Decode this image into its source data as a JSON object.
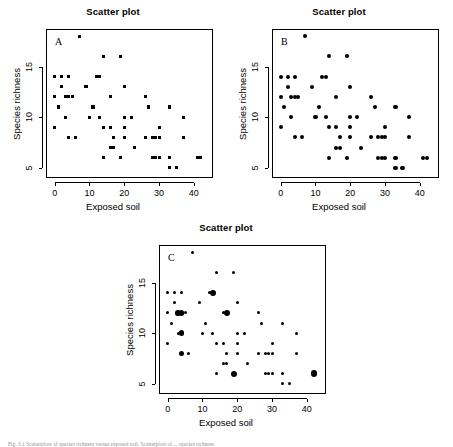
{
  "figure": {
    "caption": "Fig. 3.1 Scatterplots of species richness versus exposed soil. Scatterplots of ... species richness",
    "panels": [
      {
        "letter": "A",
        "title": "Scatter plot",
        "marker": "square"
      },
      {
        "letter": "B",
        "title": "Scatter plot",
        "marker": "circle"
      },
      {
        "letter": "C",
        "title": "Scatter plot",
        "marker": "bubble"
      }
    ]
  },
  "chart_data": [
    {
      "type": "scatter",
      "panel": "A",
      "title": "Scatter plot",
      "xlabel": "Exposed soil",
      "ylabel": "Species richness",
      "xlim": [
        -2.5,
        45.5
      ],
      "ylim": [
        4.0,
        18.7
      ],
      "xticks": [
        0,
        10,
        20,
        30,
        40
      ],
      "yticks": [
        5,
        10,
        15
      ],
      "grid": false,
      "marker": "filled-square",
      "marker_size": 3.0,
      "color": "#000000",
      "points": [
        {
          "x": 0,
          "y": 14
        },
        {
          "x": 0,
          "y": 12
        },
        {
          "x": 0,
          "y": 9
        },
        {
          "x": 1,
          "y": 11
        },
        {
          "x": 2,
          "y": 14
        },
        {
          "x": 2,
          "y": 13
        },
        {
          "x": 3,
          "y": 12
        },
        {
          "x": 3,
          "y": 10
        },
        {
          "x": 4,
          "y": 14
        },
        {
          "x": 4,
          "y": 12
        },
        {
          "x": 4,
          "y": 8
        },
        {
          "x": 5,
          "y": 12
        },
        {
          "x": 6,
          "y": 8
        },
        {
          "x": 7,
          "y": 18
        },
        {
          "x": 9,
          "y": 13
        },
        {
          "x": 10,
          "y": 10
        },
        {
          "x": 11,
          "y": 11
        },
        {
          "x": 12,
          "y": 14
        },
        {
          "x": 13,
          "y": 14
        },
        {
          "x": 13,
          "y": 10
        },
        {
          "x": 14,
          "y": 16
        },
        {
          "x": 14,
          "y": 9
        },
        {
          "x": 14,
          "y": 6
        },
        {
          "x": 16,
          "y": 12
        },
        {
          "x": 16,
          "y": 9
        },
        {
          "x": 16,
          "y": 7
        },
        {
          "x": 17,
          "y": 7
        },
        {
          "x": 17,
          "y": 8
        },
        {
          "x": 19,
          "y": 16
        },
        {
          "x": 19,
          "y": 6
        },
        {
          "x": 20,
          "y": 13
        },
        {
          "x": 20,
          "y": 10
        },
        {
          "x": 20,
          "y": 9
        },
        {
          "x": 20,
          "y": 8
        },
        {
          "x": 22,
          "y": 10
        },
        {
          "x": 23,
          "y": 7
        },
        {
          "x": 26,
          "y": 12
        },
        {
          "x": 26,
          "y": 8
        },
        {
          "x": 27,
          "y": 11
        },
        {
          "x": 28,
          "y": 8
        },
        {
          "x": 28,
          "y": 6
        },
        {
          "x": 29,
          "y": 6
        },
        {
          "x": 29,
          "y": 8
        },
        {
          "x": 30,
          "y": 9
        },
        {
          "x": 30,
          "y": 8
        },
        {
          "x": 30,
          "y": 6
        },
        {
          "x": 33,
          "y": 11
        },
        {
          "x": 33,
          "y": 6
        },
        {
          "x": 33,
          "y": 5
        },
        {
          "x": 35,
          "y": 5
        },
        {
          "x": 37,
          "y": 10
        },
        {
          "x": 37,
          "y": 8
        },
        {
          "x": 41,
          "y": 6
        },
        {
          "x": 42,
          "y": 6
        }
      ]
    },
    {
      "type": "scatter",
      "panel": "B",
      "title": "Scatter plot",
      "xlabel": "Exposed soil",
      "ylabel": "Species richness",
      "xlim": [
        -2.5,
        45.5
      ],
      "ylim": [
        4.0,
        18.7
      ],
      "xticks": [
        0,
        10,
        20,
        30,
        40
      ],
      "yticks": [
        5,
        10,
        15
      ],
      "grid": false,
      "marker": "filled-circle",
      "marker_size": 4.0,
      "color": "#000000",
      "points": [
        {
          "x": 0,
          "y": 14
        },
        {
          "x": 0,
          "y": 12
        },
        {
          "x": 0,
          "y": 9
        },
        {
          "x": 1,
          "y": 11
        },
        {
          "x": 2,
          "y": 14
        },
        {
          "x": 2,
          "y": 13
        },
        {
          "x": 3,
          "y": 12
        },
        {
          "x": 3,
          "y": 10
        },
        {
          "x": 4,
          "y": 14
        },
        {
          "x": 4,
          "y": 12
        },
        {
          "x": 4,
          "y": 8
        },
        {
          "x": 5,
          "y": 12
        },
        {
          "x": 6,
          "y": 8
        },
        {
          "x": 7,
          "y": 18
        },
        {
          "x": 9,
          "y": 13
        },
        {
          "x": 10,
          "y": 10
        },
        {
          "x": 11,
          "y": 11
        },
        {
          "x": 12,
          "y": 14
        },
        {
          "x": 13,
          "y": 14
        },
        {
          "x": 13,
          "y": 10
        },
        {
          "x": 14,
          "y": 16
        },
        {
          "x": 14,
          "y": 9
        },
        {
          "x": 14,
          "y": 6
        },
        {
          "x": 16,
          "y": 12
        },
        {
          "x": 16,
          "y": 9
        },
        {
          "x": 16,
          "y": 7
        },
        {
          "x": 17,
          "y": 7
        },
        {
          "x": 17,
          "y": 8
        },
        {
          "x": 19,
          "y": 16
        },
        {
          "x": 19,
          "y": 6
        },
        {
          "x": 20,
          "y": 13
        },
        {
          "x": 20,
          "y": 10
        },
        {
          "x": 20,
          "y": 9
        },
        {
          "x": 20,
          "y": 8
        },
        {
          "x": 22,
          "y": 10
        },
        {
          "x": 23,
          "y": 7
        },
        {
          "x": 26,
          "y": 12
        },
        {
          "x": 26,
          "y": 8
        },
        {
          "x": 27,
          "y": 11
        },
        {
          "x": 28,
          "y": 8
        },
        {
          "x": 28,
          "y": 6
        },
        {
          "x": 29,
          "y": 6
        },
        {
          "x": 29,
          "y": 8
        },
        {
          "x": 30,
          "y": 9
        },
        {
          "x": 30,
          "y": 8
        },
        {
          "x": 30,
          "y": 6
        },
        {
          "x": 33,
          "y": 11
        },
        {
          "x": 33,
          "y": 6
        },
        {
          "x": 33,
          "y": 5
        },
        {
          "x": 35,
          "y": 5
        },
        {
          "x": 37,
          "y": 10
        },
        {
          "x": 37,
          "y": 8
        },
        {
          "x": 41,
          "y": 6
        },
        {
          "x": 42,
          "y": 6
        }
      ]
    },
    {
      "type": "scatter",
      "panel": "C",
      "title": "Scatter plot",
      "xlabel": "Exposed soil",
      "ylabel": "Species richness",
      "xlim": [
        -2.5,
        45.5
      ],
      "ylim": [
        4.0,
        18.7
      ],
      "xticks": [
        0,
        10,
        20,
        30,
        40
      ],
      "yticks": [
        5,
        10,
        15
      ],
      "grid": false,
      "marker": "bubble",
      "size_meaning": "marker area proportional to number of coincident observations",
      "color": "#000000",
      "points": [
        {
          "x": 0,
          "y": 14,
          "size": 1
        },
        {
          "x": 0,
          "y": 12,
          "size": 1
        },
        {
          "x": 0,
          "y": 9,
          "size": 1
        },
        {
          "x": 1,
          "y": 11,
          "size": 1
        },
        {
          "x": 2,
          "y": 14,
          "size": 1
        },
        {
          "x": 2,
          "y": 13,
          "size": 1
        },
        {
          "x": 3,
          "y": 12,
          "size": 3
        },
        {
          "x": 3,
          "y": 10,
          "size": 1
        },
        {
          "x": 4,
          "y": 14,
          "size": 1
        },
        {
          "x": 4,
          "y": 12,
          "size": 3
        },
        {
          "x": 4,
          "y": 10,
          "size": 3
        },
        {
          "x": 4,
          "y": 8,
          "size": 3
        },
        {
          "x": 5,
          "y": 12,
          "size": 1
        },
        {
          "x": 6,
          "y": 8,
          "size": 1
        },
        {
          "x": 7,
          "y": 18,
          "size": 1
        },
        {
          "x": 9,
          "y": 13,
          "size": 1
        },
        {
          "x": 10,
          "y": 10,
          "size": 1
        },
        {
          "x": 11,
          "y": 11,
          "size": 1
        },
        {
          "x": 12,
          "y": 14,
          "size": 1
        },
        {
          "x": 13,
          "y": 14,
          "size": 4
        },
        {
          "x": 13,
          "y": 10,
          "size": 1
        },
        {
          "x": 14,
          "y": 16,
          "size": 1
        },
        {
          "x": 14,
          "y": 9,
          "size": 1
        },
        {
          "x": 14,
          "y": 6,
          "size": 1
        },
        {
          "x": 16,
          "y": 12,
          "size": 1
        },
        {
          "x": 16,
          "y": 9,
          "size": 1
        },
        {
          "x": 16,
          "y": 7,
          "size": 1
        },
        {
          "x": 17,
          "y": 12,
          "size": 4
        },
        {
          "x": 17,
          "y": 7,
          "size": 1
        },
        {
          "x": 17,
          "y": 8,
          "size": 1
        },
        {
          "x": 19,
          "y": 16,
          "size": 1
        },
        {
          "x": 19,
          "y": 6,
          "size": 4
        },
        {
          "x": 20,
          "y": 13,
          "size": 1
        },
        {
          "x": 20,
          "y": 10,
          "size": 1
        },
        {
          "x": 20,
          "y": 9,
          "size": 1
        },
        {
          "x": 20,
          "y": 8,
          "size": 1
        },
        {
          "x": 22,
          "y": 10,
          "size": 1
        },
        {
          "x": 23,
          "y": 7,
          "size": 1
        },
        {
          "x": 26,
          "y": 12,
          "size": 1
        },
        {
          "x": 26,
          "y": 8,
          "size": 1
        },
        {
          "x": 27,
          "y": 11,
          "size": 1
        },
        {
          "x": 28,
          "y": 8,
          "size": 1
        },
        {
          "x": 28,
          "y": 6,
          "size": 1
        },
        {
          "x": 29,
          "y": 6,
          "size": 1
        },
        {
          "x": 29,
          "y": 8,
          "size": 1
        },
        {
          "x": 30,
          "y": 9,
          "size": 1
        },
        {
          "x": 30,
          "y": 8,
          "size": 1
        },
        {
          "x": 30,
          "y": 6,
          "size": 1
        },
        {
          "x": 33,
          "y": 11,
          "size": 1
        },
        {
          "x": 33,
          "y": 6,
          "size": 1
        },
        {
          "x": 33,
          "y": 5,
          "size": 1
        },
        {
          "x": 35,
          "y": 5,
          "size": 1
        },
        {
          "x": 37,
          "y": 10,
          "size": 1
        },
        {
          "x": 37,
          "y": 8,
          "size": 1
        },
        {
          "x": 42,
          "y": 6,
          "size": 5
        }
      ]
    }
  ]
}
